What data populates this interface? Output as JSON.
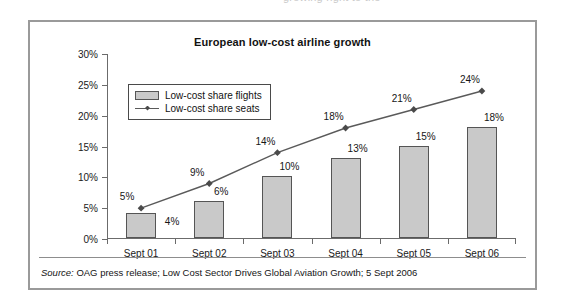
{
  "top_cut_text": "growing right to the",
  "figure": {
    "title": "European low-cost airline growth",
    "source_prefix": "Source:",
    "source_text": " OAG press release; Low Cost Sector Drives Global Aviation Growth; 5 Sept 2006"
  },
  "legend": {
    "bar_label": "Low-cost share flights",
    "line_label": "Low-cost share seats"
  },
  "chart_data": {
    "type": "bar",
    "title": "European low-cost airline growth",
    "xlabel": "",
    "ylabel": "",
    "categories": [
      "Sept 01",
      "Sept 02",
      "Sept 03",
      "Sept 04",
      "Sept 05",
      "Sept 06"
    ],
    "ylim": [
      0,
      30
    ],
    "ytick_values": [
      0,
      5,
      10,
      15,
      20,
      25,
      30
    ],
    "ytick_labels": [
      "0%",
      "5%",
      "10%",
      "15%",
      "20%",
      "25%",
      "30%"
    ],
    "grid": false,
    "legend_position": "top-left-inside",
    "series": [
      {
        "name": "Low-cost share flights",
        "type": "bar",
        "values": [
          4,
          6,
          10,
          13,
          15,
          18
        ],
        "labels": [
          "4%",
          "6%",
          "10%",
          "13%",
          "15%",
          "18%"
        ],
        "color": "#c9c9c9",
        "edge_color": "#555555"
      },
      {
        "name": "Low-cost share seats",
        "type": "line",
        "values": [
          5,
          9,
          14,
          18,
          21,
          24
        ],
        "labels": [
          "5%",
          "9%",
          "14%",
          "18%",
          "21%",
          "24%"
        ],
        "color": "#5a5a5a",
        "marker": "diamond"
      }
    ]
  }
}
